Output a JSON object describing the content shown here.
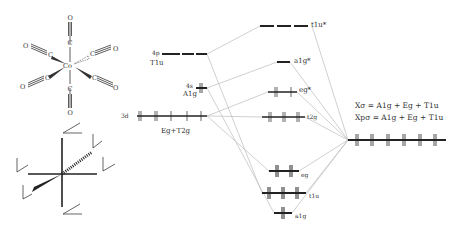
{
  "molecule": {
    "name": "Co(CO)6 octahedral complex",
    "center_atom": "Co",
    "ligand_atoms": [
      "C",
      "C",
      "C",
      "C",
      "C",
      "C"
    ],
    "terminal_atoms": [
      "O",
      "O",
      "O",
      "O",
      "O",
      "O"
    ]
  },
  "axes_sketch": {
    "description": "Octahedral coordinate frame with local pi axes on each ligand"
  },
  "metal_orbitals": {
    "p": {
      "shell": "4p",
      "symmetry": "T1u"
    },
    "s": {
      "shell": "4s",
      "symmetry": "A1g"
    },
    "d": {
      "shell": "3d",
      "symmetry": "Eg+T2g"
    }
  },
  "mo_levels": {
    "t1u_star": "t1u*",
    "a1g_star": "a1g*",
    "eg_star": "eg*",
    "t2g": "t2g",
    "eg": "eg",
    "t1u": "t1u",
    "a1g": "a1g"
  },
  "ligand_orbitals": {
    "sigma_formula": "Xσ = A1g + Eg + T1u",
    "pi_formula": "Xpσ = A1g + Eg + T1u"
  },
  "colors": {
    "level": "#222222",
    "connector": "#bbbbbb",
    "text": "#333333"
  }
}
